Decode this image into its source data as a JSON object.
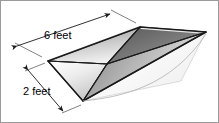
{
  "figure": {
    "shape_name": "inverted-rectangular-pyramid",
    "background_color": "#ffffff",
    "border_color": "#9a9a9a",
    "edge_color": "#1a1a1a"
  },
  "dimensions": {
    "length": {
      "label": "6 feet",
      "value": 6,
      "unit": "feet",
      "position": "top-left"
    },
    "width": {
      "label": "2 feet",
      "value": 2,
      "unit": "feet",
      "position": "bottom-left"
    }
  },
  "faces": {
    "top_rim_light": "#f2f2f2",
    "inner_back_left": "#cfcfcf",
    "inner_back_right": "#6e6e6e",
    "inner_front_left": "#e6e6e6",
    "inner_front_right": "#9d9d9d",
    "outer_bottom": "#f6f6f6",
    "outer_left": "#b8b8b8"
  }
}
